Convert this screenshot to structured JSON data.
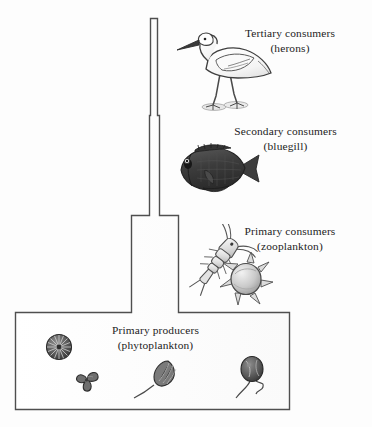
{
  "figure": {
    "type": "trophic-pyramid-diagram",
    "background_color": "#fdfdfd",
    "outline_color": "#4a4a4a",
    "text_color": "#232323"
  },
  "tiers": [
    {
      "id": "tertiary",
      "level": 4,
      "label": "Tertiary consumers",
      "sublabel": "(herons)",
      "organism_icon": "heron-icon",
      "organism_name": "heron"
    },
    {
      "id": "secondary",
      "level": 3,
      "label": "Secondary consumers",
      "sublabel": "(bluegill)",
      "organism_icon": "bluegill-fish-icon",
      "organism_name": "bluegill"
    },
    {
      "id": "primary-consumers",
      "level": 2,
      "label": "Primary consumers",
      "sublabel": "(zooplankton)",
      "organism_icon": "zooplankton-icon",
      "organism_name": "zooplankton"
    },
    {
      "id": "primary-producers",
      "level": 1,
      "label": "Primary producers",
      "sublabel": "(phytoplankton)",
      "organism_icon": "phytoplankton-icon",
      "organism_name": "phytoplankton"
    }
  ],
  "producer_organisms": [
    {
      "icon": "diatom-icon",
      "name": "diatom"
    },
    {
      "icon": "tri-lobed-alga-icon",
      "name": "tri-lobed alga"
    },
    {
      "icon": "flagellate-icon",
      "name": "flagellate"
    },
    {
      "icon": "biflagellate-cell-icon",
      "name": "biflagellate cell"
    }
  ]
}
